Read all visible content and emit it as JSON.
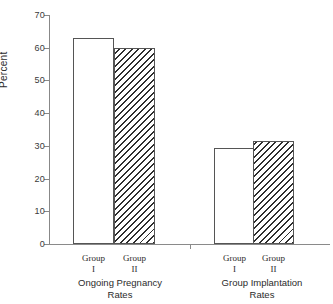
{
  "chart_data": {
    "type": "bar",
    "title": "",
    "xlabel": "",
    "ylabel": "Percent",
    "ylim": [
      0,
      70
    ],
    "ytick_step": 10,
    "yticks": [
      70,
      60,
      50,
      40,
      30,
      20,
      10,
      0
    ],
    "grid": false,
    "legend": "none",
    "groups": [
      {
        "title_line1": "Ongoing Pregnancy",
        "title_line2": "Rates",
        "bars": [
          {
            "label_line1": "Group",
            "label_line2": "I",
            "value": 63.0,
            "fill": "open"
          },
          {
            "label_line1": "Group",
            "label_line2": "II",
            "value": 60.0,
            "fill": "hatched"
          }
        ]
      },
      {
        "title_line1": "Group Implantation",
        "title_line2": "Rates",
        "bars": [
          {
            "label_line1": "Group",
            "label_line2": "I",
            "value": 29.5,
            "fill": "open"
          },
          {
            "label_line1": "Group",
            "label_line2": "II",
            "value": 31.5,
            "fill": "hatched"
          }
        ]
      }
    ],
    "categories": [
      "Ongoing Pregnancy Rates - Group I",
      "Ongoing Pregnancy Rates - Group II",
      "Group Implantation Rates - Group I",
      "Group Implantation Rates - Group II"
    ],
    "values": [
      63.0,
      60.0,
      29.5,
      31.5
    ]
  },
  "axis": {
    "y_title": "Percent",
    "y_labels": [
      "70",
      "60",
      "50",
      "40",
      "30",
      "20",
      "10",
      "0"
    ]
  },
  "colors": {
    "axis": "#888888",
    "bar_outline": "#555555",
    "hatch": "#2e2e2e",
    "text": "#2b2b2b",
    "background": "#ffffff"
  }
}
